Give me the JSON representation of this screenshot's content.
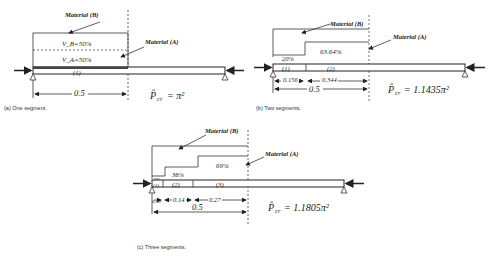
{
  "panels": [
    {
      "id": "a",
      "caption": "(a) One segment.",
      "material_b_label": "Material (B)",
      "material_a_label": "Material (A)",
      "vb_label": "V_B=50%",
      "va_label": "V_A=50%",
      "segments": [
        "(1)"
      ],
      "dims": [
        "0.5"
      ],
      "pcr_label": "P̂",
      "pcr_sub": "cr",
      "pcr_value": "= π²"
    },
    {
      "id": "b",
      "caption": "(b) Two segments.",
      "material_b_label": "Material (B)",
      "material_a_label": "Material (A)",
      "fractions": [
        "20%",
        "63.64%"
      ],
      "segments": [
        "(1)",
        "(2)"
      ],
      "dims": [
        "0.156",
        "0.344",
        "0.5"
      ],
      "pcr_label": "P̂",
      "pcr_sub": "cr",
      "pcr_value": "= 1.1435π²"
    },
    {
      "id": "c",
      "caption": "(c) Three segments.",
      "material_b_label": "Material (B)",
      "material_a_label": "Material (A)",
      "fractions": [
        "10%",
        "38%",
        "69%"
      ],
      "segments": [
        "(1)",
        "(2)",
        "(3)"
      ],
      "dims": [
        "0.09",
        "0.14",
        "0.27",
        "0.5"
      ],
      "pcr_label": "P̂",
      "pcr_sub": "cr",
      "pcr_value": "= 1.1805π²"
    }
  ]
}
